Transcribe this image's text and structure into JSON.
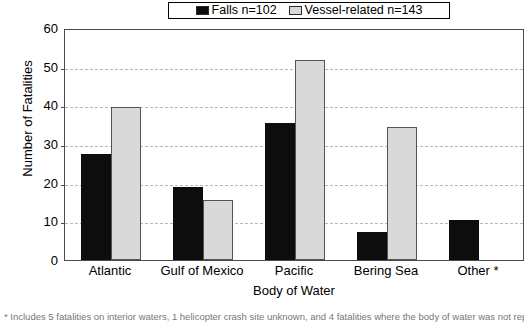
{
  "chart_data": {
    "type": "bar",
    "title": "",
    "xlabel": "Body of Water",
    "ylabel": "Number of Fatalities",
    "categories": [
      "Atlantic",
      "Gulf of Mexico",
      "Pacific",
      "Bering Sea",
      "Other *"
    ],
    "series": [
      {
        "name": "Falls n=102",
        "color": "#0d0d0d",
        "values": [
          27.5,
          18.8,
          35.5,
          7.2,
          10.3
        ]
      },
      {
        "name": "Vessel-related n=143",
        "color": "#d9d9d9",
        "values": [
          39.5,
          15.4,
          51.8,
          34.3,
          null
        ]
      }
    ],
    "ylim": [
      0,
      60
    ],
    "yticks": [
      0,
      10,
      20,
      30,
      40,
      50,
      60
    ],
    "ytick_labels": [
      "0",
      "10",
      "20",
      "30",
      "40",
      "50",
      "60"
    ],
    "grid": "horizontal-dashed",
    "legend_position": "top-center"
  },
  "legend": {
    "items": [
      {
        "label": "Falls n=102",
        "swatch": "falls"
      },
      {
        "label": "Vessel-related n=143",
        "swatch": "vessel"
      }
    ]
  },
  "footnote": {
    "text": "* Includes 5 fatalities on interior waters, 1 helicopter crash site unknown, and 4 fatalities where the body of water was not reported."
  }
}
